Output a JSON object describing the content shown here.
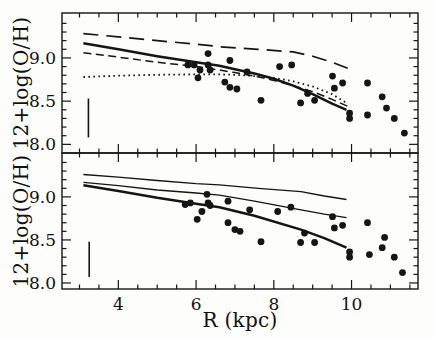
{
  "figure_caption": "",
  "chart_data": [
    {
      "id": "top-panel",
      "type": "scatter",
      "title": "",
      "xlabel": "R (kpc)",
      "ylabel": "12+log(O/H)",
      "xlim": [
        2.55,
        11.71
      ],
      "ylim": [
        7.9,
        9.52
      ],
      "x_major_ticks": [
        4,
        6,
        8,
        10
      ],
      "x_minor_step": 0.5,
      "y_major_ticks": [
        8.0,
        8.5,
        9.0
      ],
      "y_minor_step": 0.1,
      "grid": false,
      "legend": false,
      "error_bar": {
        "x": 3.23,
        "y_low": 8.08,
        "y_high": 8.53
      },
      "series": [
        {
          "name": "model-long-dash",
          "type": "line",
          "style": "long-dash",
          "points": [
            [
              3.1,
              9.28
            ],
            [
              4,
              9.245
            ],
            [
              5,
              9.2
            ],
            [
              6,
              9.16
            ],
            [
              6.6,
              9.13
            ],
            [
              7.6,
              9.1
            ],
            [
              8.5,
              9.07
            ],
            [
              9,
              9.02
            ],
            [
              9.5,
              8.95
            ],
            [
              9.9,
              8.88
            ]
          ]
        },
        {
          "name": "model-solid",
          "type": "line",
          "style": "solid-thick",
          "points": [
            [
              3.1,
              9.17
            ],
            [
              4,
              9.1
            ],
            [
              5,
              9.02
            ],
            [
              6,
              8.95
            ],
            [
              6.6,
              8.91
            ],
            [
              7,
              8.87
            ],
            [
              7.5,
              8.82
            ],
            [
              8,
              8.76
            ],
            [
              8.5,
              8.68
            ],
            [
              9,
              8.58
            ],
            [
              9.5,
              8.47
            ],
            [
              9.87,
              8.4
            ]
          ]
        },
        {
          "name": "model-short-dash",
          "type": "line",
          "style": "short-dash",
          "points": [
            [
              3.1,
              9.06
            ],
            [
              4,
              9.01
            ],
            [
              5,
              8.95
            ],
            [
              6,
              8.9
            ],
            [
              6.6,
              8.86
            ],
            [
              7,
              8.83
            ],
            [
              7.5,
              8.79
            ],
            [
              8,
              8.74
            ],
            [
              8.5,
              8.68
            ],
            [
              9,
              8.61
            ],
            [
              9.5,
              8.52
            ],
            [
              9.9,
              8.44
            ]
          ]
        },
        {
          "name": "model-dotted",
          "type": "line",
          "style": "dotted",
          "points": [
            [
              3.1,
              8.78
            ],
            [
              4,
              8.795
            ],
            [
              5,
              8.805
            ],
            [
              6,
              8.81
            ],
            [
              6.6,
              8.81
            ],
            [
              7,
              8.805
            ],
            [
              7.5,
              8.79
            ],
            [
              8,
              8.77
            ],
            [
              8.5,
              8.73
            ],
            [
              9,
              8.67
            ],
            [
              9.5,
              8.58
            ],
            [
              9.9,
              8.47
            ]
          ]
        },
        {
          "name": "hii-regions",
          "type": "scatter",
          "style": "filled-circle",
          "points": [
            [
              5.79,
              8.92
            ],
            [
              5.95,
              8.92
            ],
            [
              6.05,
              8.77
            ],
            [
              6.1,
              8.86
            ],
            [
              6.31,
              9.05
            ],
            [
              6.31,
              8.92
            ],
            [
              6.36,
              8.86
            ],
            [
              6.74,
              8.72
            ],
            [
              6.87,
              8.97
            ],
            [
              6.87,
              8.66
            ],
            [
              7.05,
              8.64
            ],
            [
              7.31,
              8.84
            ],
            [
              7.67,
              8.51
            ],
            [
              8.15,
              8.9
            ],
            [
              8.46,
              8.92
            ],
            [
              8.69,
              8.48
            ],
            [
              8.87,
              8.59
            ],
            [
              9.05,
              8.51
            ],
            [
              9.51,
              8.79
            ],
            [
              9.56,
              8.65
            ],
            [
              9.77,
              8.71
            ],
            [
              9.95,
              8.36
            ],
            [
              9.95,
              8.3
            ],
            [
              10.41,
              8.71
            ],
            [
              10.41,
              8.34
            ],
            [
              10.79,
              8.55
            ],
            [
              10.9,
              8.42
            ],
            [
              11.1,
              8.3
            ],
            [
              11.36,
              8.13
            ]
          ]
        }
      ]
    },
    {
      "id": "bottom-panel",
      "type": "scatter",
      "title": "",
      "xlabel": "R (kpc)",
      "ylabel": "12+log(O/H)",
      "xlim": [
        2.55,
        11.71
      ],
      "ylim": [
        7.93,
        9.51
      ],
      "x_major_ticks": [
        4,
        6,
        8,
        10
      ],
      "x_minor_step": 0.5,
      "y_major_ticks": [
        8.0,
        8.5,
        9.0
      ],
      "y_minor_step": 0.1,
      "grid": false,
      "legend": false,
      "error_bar": {
        "x": 3.25,
        "y_low": 8.07,
        "y_high": 8.48
      },
      "series": [
        {
          "name": "model-upper-solid-thin",
          "type": "line",
          "style": "solid-thin",
          "points": [
            [
              3.1,
              9.26
            ],
            [
              4,
              9.23
            ],
            [
              5,
              9.19
            ],
            [
              6,
              9.155
            ],
            [
              6.6,
              9.14
            ],
            [
              7.6,
              9.1
            ],
            [
              8.7,
              9.06
            ],
            [
              9.3,
              9.01
            ],
            [
              9.87,
              8.97
            ]
          ]
        },
        {
          "name": "model-middle-solid-thin",
          "type": "line",
          "style": "solid-thin",
          "points": [
            [
              3.1,
              9.17
            ],
            [
              4,
              9.13
            ],
            [
              5,
              9.08
            ],
            [
              6,
              9.045
            ],
            [
              6.6,
              9.02
            ],
            [
              7.5,
              8.95
            ],
            [
              8.7,
              8.85
            ],
            [
              9.3,
              8.8
            ],
            [
              9.87,
              8.76
            ]
          ]
        },
        {
          "name": "model-lower-solid-thick",
          "type": "line",
          "style": "solid-thick",
          "points": [
            [
              3.1,
              9.135
            ],
            [
              4,
              9.07
            ],
            [
              5,
              8.99
            ],
            [
              6,
              8.92
            ],
            [
              6.6,
              8.88
            ],
            [
              7.5,
              8.78
            ],
            [
              8.7,
              8.62
            ],
            [
              9.3,
              8.52
            ],
            [
              9.87,
              8.41
            ]
          ]
        },
        {
          "name": "hii-regions",
          "type": "scatter",
          "style": "filled-circle",
          "points": [
            [
              5.72,
              8.91
            ],
            [
              5.85,
              8.93
            ],
            [
              6.03,
              8.74
            ],
            [
              6.15,
              8.83
            ],
            [
              6.28,
              9.03
            ],
            [
              6.31,
              8.93
            ],
            [
              6.36,
              8.9
            ],
            [
              6.82,
              8.95
            ],
            [
              6.82,
              8.7
            ],
            [
              7,
              8.62
            ],
            [
              7.13,
              8.6
            ],
            [
              7.38,
              8.85
            ],
            [
              7.67,
              8.48
            ],
            [
              8.1,
              8.83
            ],
            [
              8.44,
              8.88
            ],
            [
              8.69,
              8.47
            ],
            [
              8.79,
              8.58
            ],
            [
              9.05,
              8.47
            ],
            [
              9.51,
              8.77
            ],
            [
              9.56,
              8.64
            ],
            [
              9.77,
              8.67
            ],
            [
              9.95,
              8.36
            ],
            [
              9.95,
              8.3
            ],
            [
              10.41,
              8.7
            ],
            [
              10.46,
              8.33
            ],
            [
              10.79,
              8.41
            ],
            [
              10.85,
              8.53
            ],
            [
              11.1,
              8.3
            ],
            [
              11.31,
              8.12
            ]
          ]
        }
      ]
    }
  ]
}
